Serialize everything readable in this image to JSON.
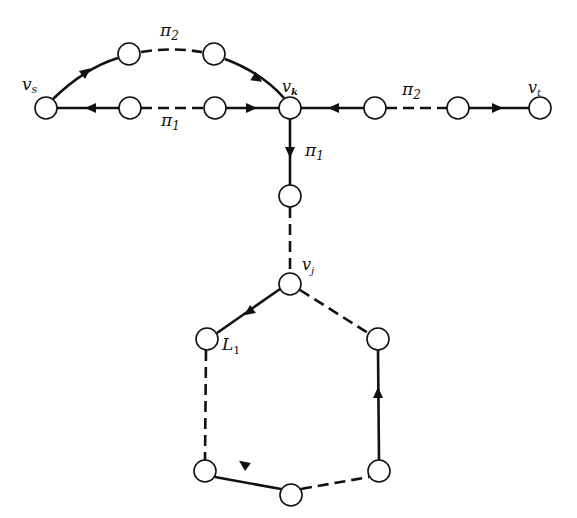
{
  "diagram": {
    "title": "",
    "colors": {
      "stroke": "#111111",
      "node_fill": "#ffffff",
      "background": "#ffffff"
    },
    "labels": {
      "vs": "v",
      "vs_sub": "s",
      "vk": "v",
      "vk_sub": "k",
      "vt": "v",
      "vt_sub": "t",
      "vj": "v",
      "vj_sub": "j",
      "pi2_top": "π",
      "pi2_top_sub": "2",
      "pi1_mid": "π",
      "pi1_mid_sub": "1",
      "pi2_right": "π",
      "pi2_right_sub": "2",
      "pi1_down": "π",
      "pi1_down_sub": "1",
      "L1": "L",
      "L1_sub": "1"
    },
    "nodes": [
      {
        "id": "vs",
        "x": 46,
        "y": 108
      },
      {
        "id": "p1a",
        "x": 130,
        "y": 108
      },
      {
        "id": "p1b",
        "x": 215,
        "y": 108
      },
      {
        "id": "vk",
        "x": 290,
        "y": 108
      },
      {
        "id": "p2a",
        "x": 129,
        "y": 54
      },
      {
        "id": "p2b",
        "x": 214,
        "y": 54
      },
      {
        "id": "r1",
        "x": 375,
        "y": 108
      },
      {
        "id": "r2",
        "x": 458,
        "y": 108
      },
      {
        "id": "vt",
        "x": 540,
        "y": 108
      },
      {
        "id": "d1",
        "x": 290,
        "y": 196
      },
      {
        "id": "vj",
        "x": 290,
        "y": 284
      },
      {
        "id": "h_l1",
        "x": 207,
        "y": 339
      },
      {
        "id": "h_r1",
        "x": 378,
        "y": 339
      },
      {
        "id": "h_l2",
        "x": 205,
        "y": 471
      },
      {
        "id": "h_r2",
        "x": 379,
        "y": 471
      },
      {
        "id": "h_b",
        "x": 291,
        "y": 495
      }
    ],
    "edges": [
      {
        "from": "vs",
        "to": "p2a",
        "style": "solid",
        "arrow": "toward p2a"
      },
      {
        "from": "p2a",
        "to": "p2b",
        "style": "dashed",
        "path": "π2"
      },
      {
        "from": "p2b",
        "to": "vk",
        "style": "solid",
        "arrow": "toward vk"
      },
      {
        "from": "p1a",
        "to": "vs",
        "style": "solid",
        "arrow": "toward vs"
      },
      {
        "from": "p1a",
        "to": "p1b",
        "style": "dashed",
        "path": "π1"
      },
      {
        "from": "p1b",
        "to": "vk",
        "style": "solid",
        "arrow": "toward vk"
      },
      {
        "from": "r1",
        "to": "vk",
        "style": "solid",
        "arrow": "toward vk"
      },
      {
        "from": "r1",
        "to": "r2",
        "style": "dashed",
        "path": "π2"
      },
      {
        "from": "r2",
        "to": "vt",
        "style": "solid",
        "arrow": "toward vt"
      },
      {
        "from": "vk",
        "to": "d1",
        "style": "solid",
        "arrow": "toward d1",
        "path": "π1"
      },
      {
        "from": "d1",
        "to": "vj",
        "style": "dashed"
      },
      {
        "from": "vj",
        "to": "h_l1",
        "style": "solid",
        "arrow": "toward h_l1"
      },
      {
        "from": "h_l1",
        "to": "h_l2",
        "style": "dashed"
      },
      {
        "from": "h_b",
        "to": "h_l2",
        "style": "solid",
        "arrow": "toward h_l2"
      },
      {
        "from": "h_b",
        "to": "h_r2",
        "style": "dashed"
      },
      {
        "from": "h_r2",
        "to": "h_r1",
        "style": "solid",
        "arrow": "toward h_r1"
      },
      {
        "from": "h_r1",
        "to": "vj",
        "style": "dashed"
      }
    ]
  }
}
